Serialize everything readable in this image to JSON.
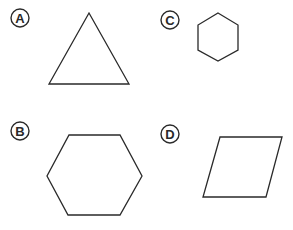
{
  "figures": [
    {
      "label": "A",
      "shape": "triangle",
      "badge": {
        "cx": 20,
        "cy": 18
      },
      "points": "89,13 129,84 49,84"
    },
    {
      "label": "C",
      "shape": "hexagon",
      "badge": {
        "cx": 170,
        "cy": 20
      },
      "points": "218,13 238,25 238,50 218,61 198,50 198,25"
    },
    {
      "label": "B",
      "shape": "hexagon",
      "badge": {
        "cx": 20,
        "cy": 131
      },
      "points": "69,135 120,135 142,176 120,215 68,215 47,176"
    },
    {
      "label": "D",
      "shape": "parallelogram",
      "badge": {
        "cx": 170,
        "cy": 134
      },
      "points": "220,137 282,137 266,197 203,197"
    }
  ],
  "colors": {
    "stroke": "#2a2a2a",
    "background": "#ffffff"
  }
}
